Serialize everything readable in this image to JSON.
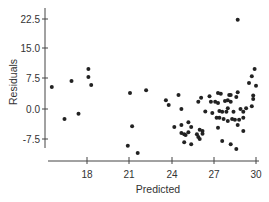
{
  "chart_data": {
    "type": "scatter",
    "title": "",
    "xlabel": "Predicted",
    "ylabel": "Residuals",
    "xlim": [
      15.0,
      30.2
    ],
    "ylim": [
      -11.5,
      25.0
    ],
    "x_ticks": [
      18,
      21,
      24,
      27,
      30
    ],
    "x_tick_labels": [
      "18",
      "21",
      "24",
      "27",
      "30"
    ],
    "y_ticks": [
      -7.5,
      0.0,
      7.5,
      15.0,
      22.5
    ],
    "y_tick_labels": [
      "-7.5",
      "0.0",
      "7.5",
      "15.0",
      "22.5"
    ],
    "grid": false,
    "legend": null,
    "marker_color": "#222222",
    "axis_color": "#444444",
    "points": [
      {
        "x": 15.5,
        "y": 5.5
      },
      {
        "x": 16.9,
        "y": 7.0
      },
      {
        "x": 18.1,
        "y": 10.0
      },
      {
        "x": 18.1,
        "y": 8.0
      },
      {
        "x": 18.3,
        "y": 6.0
      },
      {
        "x": 16.4,
        "y": -2.5
      },
      {
        "x": 17.4,
        "y": -1.2
      },
      {
        "x": 21.05,
        "y": 4.0
      },
      {
        "x": 21.2,
        "y": -4.3
      },
      {
        "x": 20.9,
        "y": -9.2
      },
      {
        "x": 21.6,
        "y": -11.0
      },
      {
        "x": 22.2,
        "y": 4.7
      },
      {
        "x": 23.6,
        "y": 2.2
      },
      {
        "x": 23.8,
        "y": 1.0
      },
      {
        "x": 24.5,
        "y": 3.5
      },
      {
        "x": 24.7,
        "y": 0.0
      },
      {
        "x": 24.2,
        "y": -4.5
      },
      {
        "x": 24.7,
        "y": -4.0
      },
      {
        "x": 25.2,
        "y": -3.3
      },
      {
        "x": 25.4,
        "y": -4.5
      },
      {
        "x": 24.7,
        "y": -6.0
      },
      {
        "x": 24.9,
        "y": -6.3
      },
      {
        "x": 25.2,
        "y": -5.8
      },
      {
        "x": 25.0,
        "y": -6.5
      },
      {
        "x": 24.9,
        "y": -8.3
      },
      {
        "x": 25.4,
        "y": -8.8
      },
      {
        "x": 25.8,
        "y": -6.3
      },
      {
        "x": 26.2,
        "y": -5.5
      },
      {
        "x": 26.0,
        "y": -7.5
      },
      {
        "x": 26.4,
        "y": -0.6
      },
      {
        "x": 25.9,
        "y": 1.8
      },
      {
        "x": 26.1,
        "y": 2.8
      },
      {
        "x": 26.7,
        "y": 3.2
      },
      {
        "x": 27.3,
        "y": 4.0
      },
      {
        "x": 27.5,
        "y": 3.8
      },
      {
        "x": 28.1,
        "y": 3.5
      },
      {
        "x": 28.6,
        "y": 3.0
      },
      {
        "x": 28.7,
        "y": 4.2
      },
      {
        "x": 30.0,
        "y": 5.8
      },
      {
        "x": 29.8,
        "y": 3.4
      },
      {
        "x": 29.8,
        "y": 2.5
      },
      {
        "x": 29.7,
        "y": 0.7
      },
      {
        "x": 29.3,
        "y": 0.2
      },
      {
        "x": 28.9,
        "y": 0.0
      },
      {
        "x": 29.1,
        "y": -0.7
      },
      {
        "x": 26.8,
        "y": 1.8
      },
      {
        "x": 27.1,
        "y": 1.8
      },
      {
        "x": 27.3,
        "y": 1.5
      },
      {
        "x": 27.8,
        "y": 2.0
      },
      {
        "x": 28.0,
        "y": 2.2
      },
      {
        "x": 28.2,
        "y": 1.8
      },
      {
        "x": 26.9,
        "y": -1.0
      },
      {
        "x": 27.4,
        "y": -0.5
      },
      {
        "x": 27.6,
        "y": -0.7
      },
      {
        "x": 27.9,
        "y": -0.7
      },
      {
        "x": 28.0,
        "y": 0.2
      },
      {
        "x": 28.4,
        "y": -0.7
      },
      {
        "x": 27.2,
        "y": -2.2
      },
      {
        "x": 27.4,
        "y": -2.2
      },
      {
        "x": 27.7,
        "y": -2.5
      },
      {
        "x": 28.0,
        "y": -3.0
      },
      {
        "x": 28.3,
        "y": -2.5
      },
      {
        "x": 28.5,
        "y": -2.7
      },
      {
        "x": 28.8,
        "y": -2.7
      },
      {
        "x": 28.7,
        "y": -4.0
      },
      {
        "x": 29.1,
        "y": -2.2
      },
      {
        "x": 27.3,
        "y": -4.7
      },
      {
        "x": 29.1,
        "y": -5.5
      },
      {
        "x": 26.0,
        "y": -5.2
      },
      {
        "x": 26.2,
        "y": -6.2
      },
      {
        "x": 25.9,
        "y": -7.0
      },
      {
        "x": 27.6,
        "y": -8.0
      },
      {
        "x": 28.2,
        "y": -8.8
      },
      {
        "x": 28.6,
        "y": -10.0
      },
      {
        "x": 28.7,
        "y": 22.3
      },
      {
        "x": 29.9,
        "y": 10.0
      },
      {
        "x": 29.7,
        "y": 8.2
      },
      {
        "x": 29.5,
        "y": 6.5
      },
      {
        "x": 28.2,
        "y": 3.5
      }
    ]
  },
  "axes": {
    "x_title": "Predicted",
    "y_title": "Residuals",
    "x_tick_labels": [
      "18",
      "21",
      "24",
      "27",
      "30"
    ],
    "y_tick_labels": [
      "22.5",
      "15.0",
      "7.5",
      "0.0",
      "-7.5"
    ]
  }
}
